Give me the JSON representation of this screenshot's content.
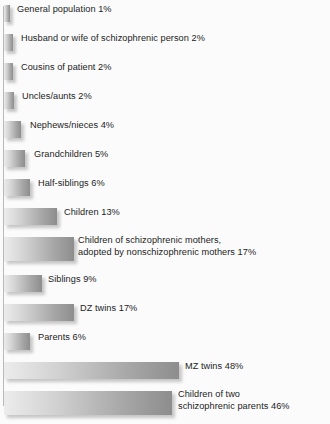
{
  "chart_data": {
    "type": "bar",
    "title": "",
    "xlabel": "",
    "ylabel": "",
    "orientation": "horizontal",
    "grid": false,
    "legend": false,
    "xlim": [
      0,
      48
    ],
    "unit": "%",
    "categories": [
      "General population",
      "Husband or wife of schizophrenic person",
      "Cousins of patient",
      "Uncles/aunts",
      "Nephews/nieces",
      "Grandchildren",
      "Half-siblings",
      "Children",
      "Children of schizophrenic mothers, adopted by nonschizophrenic mothers",
      "Siblings",
      "DZ twins",
      "Parents",
      "MZ twins",
      "Children of two schizophrenic parents"
    ],
    "values": [
      1,
      2,
      2,
      2,
      4,
      5,
      6,
      13,
      17,
      9,
      17,
      6,
      48,
      46
    ]
  },
  "bars": [
    {
      "label": "General population 1%",
      "label2": "",
      "value": 1,
      "bar_px": 6,
      "label_x": 17,
      "tall": false
    },
    {
      "label": "Husband or wife of schizophrenic person 2%",
      "label2": "",
      "value": 2,
      "bar_px": 9,
      "label_x": 21,
      "tall": false
    },
    {
      "label": "Cousins of patient 2%",
      "label2": "",
      "value": 2,
      "bar_px": 9,
      "label_x": 21,
      "tall": false
    },
    {
      "label": "Uncles/aunts 2%",
      "label2": "",
      "value": 2,
      "bar_px": 10,
      "label_x": 22,
      "tall": false
    },
    {
      "label": "Nephews/nieces 4%",
      "label2": "",
      "value": 4,
      "bar_px": 17,
      "label_x": 30,
      "tall": false
    },
    {
      "label": "Grandchildren 5%",
      "label2": "",
      "value": 5,
      "bar_px": 21,
      "label_x": 34,
      "tall": false
    },
    {
      "label": "Half-siblings 6%",
      "label2": "",
      "value": 6,
      "bar_px": 26,
      "label_x": 38,
      "tall": false
    },
    {
      "label": "Children 13%",
      "label2": "",
      "value": 13,
      "bar_px": 53,
      "label_x": 64,
      "tall": false
    },
    {
      "label": "Children of schizophrenic mothers,",
      "label2": "adopted by nonschizophrenic mothers 17%",
      "value": 17,
      "bar_px": 70,
      "label_x": 78,
      "tall": true
    },
    {
      "label": "Siblings 9%",
      "label2": "",
      "value": 9,
      "bar_px": 38,
      "label_x": 48,
      "tall": false
    },
    {
      "label": "DZ twins 17%",
      "label2": "",
      "value": 17,
      "bar_px": 70,
      "label_x": 80,
      "tall": false
    },
    {
      "label": "Parents 6%",
      "label2": "",
      "value": 6,
      "bar_px": 26,
      "label_x": 38,
      "tall": false
    },
    {
      "label": "MZ twins 48%",
      "label2": "",
      "value": 48,
      "bar_px": 175,
      "label_x": 185,
      "tall": false
    },
    {
      "label": "Children of two",
      "label2": "schizophrenic parents 46%",
      "value": 46,
      "bar_px": 168,
      "label_x": 178,
      "tall": true
    }
  ],
  "colors": {
    "background": "#fbfbfb",
    "bar_light": "#ececec",
    "bar_dark": "#8d8d8d",
    "axis": "#b9b9b9",
    "text": "#1b1b1b"
  }
}
